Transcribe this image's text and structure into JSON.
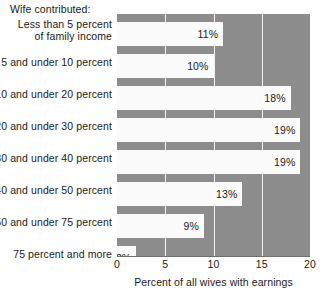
{
  "header": {
    "title": "Wife contributed:"
  },
  "chart_data": {
    "type": "bar",
    "orientation": "horizontal",
    "title": "Wife contributed:",
    "xlabel": "Percent of all wives with earnings",
    "ylabel": "",
    "xlim": [
      0,
      20
    ],
    "xticks": [
      0,
      5,
      10,
      15,
      20
    ],
    "xtick_labels": [
      "0",
      "5",
      "10",
      "15",
      "20"
    ],
    "grid": true,
    "legend": false,
    "bar_color": "#fbfbfb",
    "background_color": "#8d8d8d",
    "categories": [
      "Less than 5 percent of family income",
      "5 and under 10 percent",
      "10 and under 20 percent",
      "20 and under 30 percent",
      "30 and under 40 percent",
      "40 and under 50 percent",
      "50 and under 75 percent",
      "75 percent and more"
    ],
    "values": [
      11,
      10,
      18,
      19,
      19,
      13,
      9,
      2
    ],
    "value_labels": [
      "11%",
      "10%",
      "18%",
      "19%",
      "19%",
      "13%",
      "9%",
      "2%"
    ]
  },
  "categories_display": [
    {
      "line1": "Less than 5 percent",
      "line2": "of family income"
    },
    {
      "line1": "5 and under 10 percent",
      "line2": ""
    },
    {
      "line1": "10 and under 20 percent",
      "line2": ""
    },
    {
      "line1": "20 and under 30 percent",
      "line2": ""
    },
    {
      "line1": "30 and under 40 percent",
      "line2": ""
    },
    {
      "line1": "40 and under 50 percent",
      "line2": ""
    },
    {
      "line1": "50 and under 75 percent",
      "line2": ""
    },
    {
      "line1": "75 percent and more",
      "line2": ""
    }
  ],
  "axis": {
    "title": "Percent of all wives with earnings"
  }
}
